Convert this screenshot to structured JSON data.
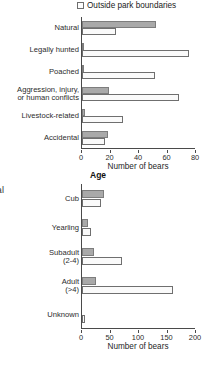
{
  "figure": {
    "stray_label": "tal",
    "legend": {
      "marker": "open-square",
      "label": "Outside park boundaries"
    }
  },
  "chart_data": [
    {
      "type": "bar",
      "orientation": "horizontal",
      "title": "",
      "xlabel": "Number of bears",
      "ylabel": "",
      "xlim": [
        0,
        80
      ],
      "xticks": [
        0,
        20,
        40,
        60,
        80
      ],
      "grid": false,
      "legend_position": "top-right",
      "categories": [
        "Natural",
        "Legally hunted",
        "Poached",
        "Aggression, injury,|or human conflicts",
        "Livestock-related",
        "Accidental"
      ],
      "series": [
        {
          "name": "Inside park boundaries",
          "fill": "#a9a9a9",
          "values": [
            52,
            1,
            1,
            19,
            2,
            18
          ]
        },
        {
          "name": "Outside park boundaries",
          "fill": "#fafafa",
          "values": [
            24,
            75,
            51,
            68,
            29,
            16
          ]
        }
      ]
    },
    {
      "type": "bar",
      "orientation": "horizontal",
      "title": "Age",
      "xlabel": "Number of bears",
      "ylabel": "",
      "xlim": [
        0,
        200
      ],
      "xticks": [
        0,
        50,
        100,
        150,
        200
      ],
      "grid": false,
      "legend_position": "none",
      "categories": [
        "Cub",
        "Yearling",
        "Subadult|(2-4)",
        "Adult|(>4)",
        "Unknown"
      ],
      "series": [
        {
          "name": "Inside park boundaries",
          "fill": "#a9a9a9",
          "values": [
            38,
            10,
            21,
            24,
            0
          ]
        },
        {
          "name": "Outside park boundaries",
          "fill": "#fafafa",
          "values": [
            34,
            16,
            70,
            160,
            6
          ]
        }
      ]
    }
  ]
}
